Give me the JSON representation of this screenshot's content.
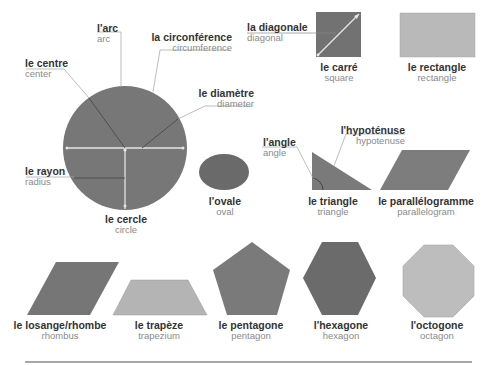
{
  "colors": {
    "dark_gray": "#6d6d6d",
    "medium_gray": "#808080",
    "light_gray": "#b9b9b9",
    "line_gray": "#9a9a9a",
    "white_line": "#e8e8e8",
    "text_french": "#333333",
    "text_english": "#8a8a8a"
  },
  "circle_parts": {
    "arc": {
      "fr": "l'arc",
      "en": "arc"
    },
    "circumference": {
      "fr": "la circonférence",
      "en": "circumference"
    },
    "center": {
      "fr": "le centre",
      "en": "center"
    },
    "diameter": {
      "fr": "le diamètre",
      "en": "diameter"
    },
    "radius": {
      "fr": "le rayon",
      "en": "radius"
    }
  },
  "square_parts": {
    "diagonal": {
      "fr": "la diagonale",
      "en": "diagonal"
    }
  },
  "triangle_parts": {
    "angle": {
      "fr": "l'angle",
      "en": "angle"
    },
    "hypotenuse": {
      "fr": "l'hypoténuse",
      "en": "hypotenuse"
    }
  },
  "shapes": {
    "circle": {
      "fr": "le cercle",
      "en": "circle"
    },
    "oval": {
      "fr": "l'ovale",
      "en": "oval"
    },
    "square": {
      "fr": "le carré",
      "en": "square"
    },
    "rectangle": {
      "fr": "le rectangle",
      "en": "rectangle"
    },
    "triangle": {
      "fr": "le triangle",
      "en": "triangle"
    },
    "parallelogram": {
      "fr": "le parallélogramme",
      "en": "parallelogram"
    },
    "rhombus": {
      "fr": "le losange/rhombe",
      "en": "rhombus"
    },
    "trapezium": {
      "fr": "le trapèze",
      "en": "trapezium"
    },
    "pentagon": {
      "fr": "le pentagone",
      "en": "pentagon"
    },
    "hexagon": {
      "fr": "l'hexagone",
      "en": "hexagon"
    },
    "octagon": {
      "fr": "l'octogone",
      "en": "octagon"
    }
  }
}
